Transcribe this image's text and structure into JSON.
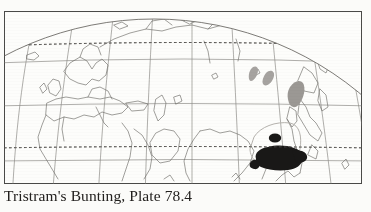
{
  "figure": {
    "caption": "Tristram's Bunting, Plate 78.4",
    "species_common_name": "Tristram's Bunting",
    "plate_reference": "Plate 78.4",
    "type": "species-distribution-map",
    "projection": "globe / orthographic-style graticule",
    "frame": {
      "border_color": "#4a4a48",
      "background_color": "#fdfdfb"
    }
  },
  "map": {
    "name": "distribution-map",
    "background_color": "#fdfdfb",
    "coastline_color": "#6e6c68",
    "graticule_color": "#8e8c88",
    "globe_outline_color": "#6e6c68",
    "latitude_lines": [
      {
        "name": "dotted-latitude-upper",
        "style": "dashed",
        "y": 46
      },
      {
        "name": "solid-latitude-upper",
        "style": "solid",
        "y": 63
      },
      {
        "name": "solid-latitude-mid",
        "style": "solid",
        "y": 106
      },
      {
        "name": "dotted-latitude-lower",
        "style": "dashed",
        "y": 148
      },
      {
        "name": "solid-latitude-lower",
        "style": "solid",
        "y": 161
      }
    ],
    "meridian_count": 11
  },
  "ranges": [
    {
      "name": "wintering-range",
      "label": "wintering range",
      "color": "#191817",
      "shape": "large irregular blob, south-east China"
    },
    {
      "name": "wintering-range-outlier-dot",
      "label": "outlier population",
      "color": "#191817",
      "shape": "small ellipse north of main blob"
    },
    {
      "name": "breeding-range",
      "label": "breeding range",
      "color": "#9b9894",
      "shape": "grey patch, Korea / Ussuriland"
    },
    {
      "name": "passage-range-japan",
      "label": "passage / Japan islands",
      "color": "#a6a3a0",
      "shape": "two small grey streaks over Japan"
    },
    {
      "name": "range-boundary-china",
      "label": "range boundary outline",
      "color": "#b6b3ae",
      "shape": "faint outline enclosing southern China"
    }
  ]
}
